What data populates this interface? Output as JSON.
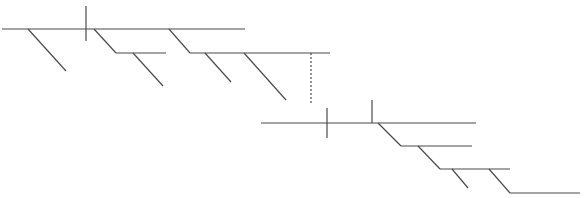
{
  "diagram": {
    "type": "sentence-diagram",
    "line_color": "#4a4a4a",
    "background": "#ffffff",
    "clauses": [
      {
        "name": "upper-clause",
        "baseline": {
          "x1": 2,
          "y1": 29,
          "x2": 245,
          "y2": 29
        },
        "dividers": [
          {
            "x": 86,
            "y1": 6,
            "y2": 41
          }
        ],
        "modifiers": [
          {
            "x1": 28,
            "y1": 29,
            "x2": 66,
            "y2": 71
          },
          {
            "x1": 94,
            "y1": 29,
            "x2": 116,
            "y2": 53
          },
          {
            "x1": 116,
            "y1": 53,
            "x2": 166,
            "y2": 53
          },
          {
            "x1": 133,
            "y1": 53,
            "x2": 163,
            "y2": 86
          },
          {
            "x1": 169,
            "y1": 29,
            "x2": 190,
            "y2": 53
          },
          {
            "x1": 190,
            "y1": 53,
            "x2": 330,
            "y2": 53
          },
          {
            "x1": 205,
            "y1": 53,
            "x2": 231,
            "y2": 82
          },
          {
            "x1": 244,
            "y1": 53,
            "x2": 286,
            "y2": 100
          }
        ]
      },
      {
        "name": "lower-clause",
        "baseline": {
          "x1": 261,
          "y1": 123,
          "x2": 476,
          "y2": 123
        },
        "dividers": [
          {
            "x": 327,
            "y1": 108,
            "y2": 138
          },
          {
            "x": 372,
            "y1": 100,
            "y2": 123
          }
        ],
        "modifiers": [
          {
            "x1": 378,
            "y1": 123,
            "x2": 401,
            "y2": 146
          },
          {
            "x1": 401,
            "y1": 146,
            "x2": 472,
            "y2": 146
          },
          {
            "x1": 418,
            "y1": 146,
            "x2": 440,
            "y2": 169
          },
          {
            "x1": 440,
            "y1": 169,
            "x2": 510,
            "y2": 169
          },
          {
            "x1": 452,
            "y1": 169,
            "x2": 468,
            "y2": 188
          },
          {
            "x1": 489,
            "y1": 169,
            "x2": 510,
            "y2": 193
          },
          {
            "x1": 510,
            "y1": 193,
            "x2": 580,
            "y2": 193
          }
        ]
      }
    ],
    "connector": {
      "style": "dashed",
      "x": 311,
      "y1": 53,
      "y2": 103
    }
  }
}
